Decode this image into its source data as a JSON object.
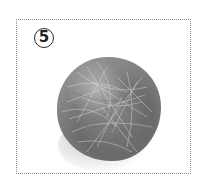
{
  "figure": {
    "label": "5",
    "colors": {
      "ball": "#757575",
      "fibers": "#d8d8d8",
      "frame": "#8a8a8a",
      "background": "#ffffff"
    }
  }
}
